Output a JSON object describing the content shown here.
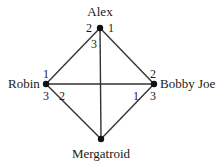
{
  "figure": {
    "background_color": "#ffffff",
    "line_color": "#333333",
    "text_color": "#1a1a1a",
    "width": 219,
    "height": 168
  },
  "nodes": [
    {
      "id": "alex",
      "label": "Alex",
      "x": 100,
      "y": 28,
      "label_x": 100,
      "label_y": 5,
      "label_align": "center"
    },
    {
      "id": "robin",
      "label": "Robin",
      "x": 46,
      "y": 84,
      "label_x": 8,
      "label_y": 77,
      "label_align": "left"
    },
    {
      "id": "bobby_joe",
      "label": "Bobby Joe",
      "x": 154,
      "y": 84,
      "label_x": 160,
      "label_y": 77,
      "label_align": "left"
    },
    {
      "id": "mergatroid",
      "label": "Mergatroid",
      "x": 101,
      "y": 139,
      "label_x": 101,
      "label_y": 147,
      "label_align": "center"
    }
  ],
  "edges": [
    {
      "id": "alex-robin",
      "from": "alex",
      "to": "robin"
    },
    {
      "id": "alex-bobby_joe",
      "from": "alex",
      "to": "bobby_joe"
    },
    {
      "id": "alex-mergatroid",
      "from": "alex",
      "to": "mergatroid"
    },
    {
      "id": "robin-bobby_joe",
      "from": "robin",
      "to": "bobby_joe"
    },
    {
      "id": "robin-mergatroid",
      "from": "robin",
      "to": "mergatroid"
    },
    {
      "id": "bobby_joe-mergatroid",
      "from": "bobby_joe",
      "to": "mergatroid"
    }
  ],
  "edge_labels": [
    {
      "id": "alex-left",
      "node": "alex",
      "value": "2",
      "x": 86,
      "y": 22
    },
    {
      "id": "alex-right",
      "node": "alex",
      "value": "1",
      "x": 108,
      "y": 22
    },
    {
      "id": "alex-below",
      "node": "alex",
      "value": "3",
      "x": 91,
      "y": 38
    },
    {
      "id": "robin-above",
      "node": "robin",
      "value": "1",
      "x": 43,
      "y": 68
    },
    {
      "id": "robin-below",
      "node": "robin",
      "value": "3",
      "x": 43,
      "y": 90
    },
    {
      "id": "robin-diag",
      "node": "robin",
      "value": "2",
      "x": 59,
      "y": 90
    },
    {
      "id": "bobby-above",
      "node": "bobby_joe",
      "value": "2",
      "x": 150,
      "y": 68
    },
    {
      "id": "bobby-below",
      "node": "bobby_joe",
      "value": "3",
      "x": 150,
      "y": 90
    },
    {
      "id": "bobby-diag",
      "node": "bobby_joe",
      "value": "1",
      "x": 133,
      "y": 90
    }
  ],
  "chart_data": {
    "type": "graph",
    "title": "",
    "vertices": [
      "Alex",
      "Robin",
      "Bobby Joe",
      "Mergatroid"
    ],
    "edges": [
      [
        "Alex",
        "Robin"
      ],
      [
        "Alex",
        "Bobby Joe"
      ],
      [
        "Alex",
        "Mergatroid"
      ],
      [
        "Robin",
        "Bobby Joe"
      ],
      [
        "Robin",
        "Mergatroid"
      ],
      [
        "Bobby Joe",
        "Mergatroid"
      ]
    ],
    "vertex_edge_numbers": {
      "Alex": [
        "2",
        "1",
        "3"
      ],
      "Robin": [
        "1",
        "3",
        "2"
      ],
      "Bobby Joe": [
        "2",
        "3",
        "1"
      ],
      "Mergatroid": []
    }
  }
}
